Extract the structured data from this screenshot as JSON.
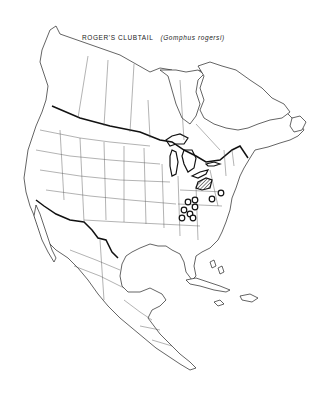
{
  "map": {
    "title": "ROGER'S CLUBTAIL",
    "scientific_name": "(Gomphus rogersi)",
    "region": "North America",
    "range_type": "species distribution",
    "legend_symbols": [
      {
        "symbol": "circled-dot",
        "meaning": "locality record"
      },
      {
        "symbol": "hatched-area",
        "meaning": "range area"
      }
    ],
    "range_areas": [
      {
        "name": "range-area-ohio-pennsylvania",
        "style": "hatched"
      }
    ],
    "range_points": [
      {
        "name": "record-1"
      },
      {
        "name": "record-2"
      },
      {
        "name": "record-3"
      },
      {
        "name": "record-4"
      },
      {
        "name": "record-5"
      },
      {
        "name": "record-6"
      },
      {
        "name": "record-7"
      },
      {
        "name": "record-8"
      },
      {
        "name": "record-9"
      }
    ]
  }
}
